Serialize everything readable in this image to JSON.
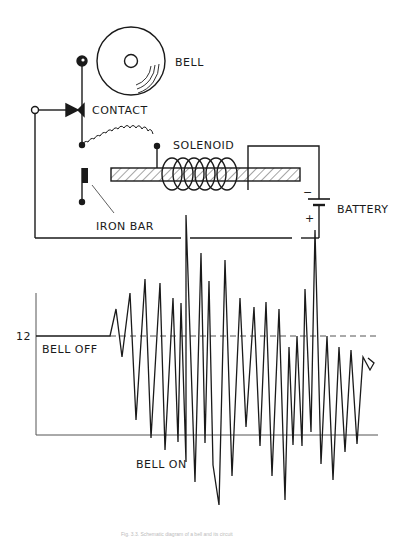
{
  "labels": {
    "bell": "BELL",
    "contact": "CONTACT",
    "solenoid": "SOLENOID",
    "iron_bar": "IRON BAR",
    "battery": "BATTERY",
    "battery_minus": "−",
    "battery_plus": "+",
    "axis_tick": "12",
    "bell_off": "BELL OFF",
    "bell_on": "BELL ON"
  },
  "caption": "Fig. 3.3. Schematic diagram of a bell and its circuit",
  "colors": {
    "ink": "#1a1a1a",
    "background": "#ffffff",
    "baseline": "#555555"
  },
  "waveform": {
    "baseline_label": "12",
    "dashed_level_y": 336,
    "lower_line_y": 435,
    "points": [
      [
        36,
        336
      ],
      [
        110,
        336
      ],
      [
        116,
        309
      ],
      [
        122,
        357
      ],
      [
        130,
        293
      ],
      [
        136,
        420
      ],
      [
        145,
        279
      ],
      [
        151,
        438
      ],
      [
        160,
        283
      ],
      [
        165,
        450
      ],
      [
        173,
        298
      ],
      [
        178,
        442
      ],
      [
        181,
        303
      ],
      [
        186,
        462
      ],
      [
        186,
        215
      ],
      [
        195,
        482
      ],
      [
        201,
        253
      ],
      [
        205,
        443
      ],
      [
        209,
        281
      ],
      [
        213,
        465
      ],
      [
        219,
        505
      ],
      [
        225,
        260
      ],
      [
        232,
        476
      ],
      [
        240,
        298
      ],
      [
        246,
        427
      ],
      [
        254,
        307
      ],
      [
        260,
        446
      ],
      [
        266,
        302
      ],
      [
        272,
        476
      ],
      [
        279,
        309
      ],
      [
        285,
        500
      ],
      [
        289,
        347
      ],
      [
        293,
        445
      ],
      [
        297,
        336
      ],
      [
        302,
        446
      ],
      [
        305,
        289
      ],
      [
        311,
        432
      ],
      [
        315,
        230
      ],
      [
        321,
        464
      ],
      [
        327,
        336
      ],
      [
        333,
        480
      ],
      [
        339,
        347
      ],
      [
        345,
        452
      ],
      [
        351,
        350
      ],
      [
        357,
        444
      ],
      [
        363,
        357
      ],
      [
        370,
        370
      ],
      [
        374,
        363
      ],
      [
        368,
        358
      ]
    ]
  }
}
